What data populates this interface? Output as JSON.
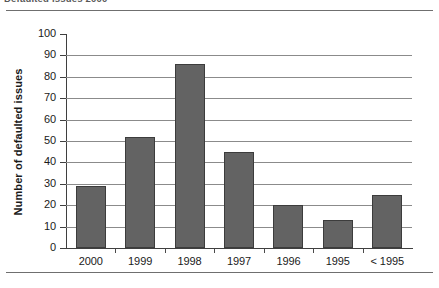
{
  "caption": {
    "text": "Defaulted issues 2000"
  },
  "chart_data": {
    "type": "bar",
    "title": "",
    "xlabel": "",
    "ylabel": "Number of defaulted issues",
    "categories": [
      "2000",
      "1999",
      "1998",
      "1997",
      "1996",
      "1995",
      "< 1995"
    ],
    "values": [
      29,
      52,
      86,
      45,
      20,
      13,
      25
    ],
    "series": [
      {
        "name": "Number of defaulted issues",
        "values": [
          29,
          52,
          86,
          45,
          20,
          13,
          25
        ]
      }
    ],
    "ylim": [
      0,
      100
    ],
    "ytick_labels": [
      "0",
      "10",
      "20",
      "30",
      "40",
      "50",
      "60",
      "70",
      "80",
      "90",
      "100"
    ],
    "ytick_values": [
      0,
      10,
      20,
      30,
      40,
      50,
      60,
      70,
      80,
      90,
      100
    ],
    "grid": true,
    "grid_axis": "y",
    "legend": false,
    "legend_position": "none",
    "bar_color": "#636363",
    "bar_border_color": "#3c3c3c",
    "gridline_color": "#8b8b8b",
    "axis_color": "#3f3f3f",
    "background_color": "#ffffff",
    "annotations": []
  }
}
